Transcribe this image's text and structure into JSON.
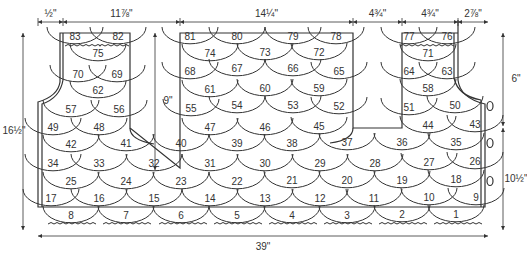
{
  "diagram": {
    "stroke_color": "#333333",
    "background": "#ffffff",
    "dimensions": {
      "top": [
        {
          "id": "left-strap-edge",
          "label": "½\"",
          "x1": 38,
          "x2": 63
        },
        {
          "id": "left-neck",
          "label": "11⅞\"",
          "x1": 63,
          "x2": 180
        },
        {
          "id": "back-neck",
          "label": "14¼\"",
          "x1": 180,
          "x2": 353
        },
        {
          "id": "right-neck",
          "label": "4¾\"",
          "x1": 353,
          "x2": 402
        },
        {
          "id": "right-strap",
          "label": "4¾\"",
          "x1": 402,
          "x2": 458
        },
        {
          "id": "right-armhole",
          "label": "2⅞\"",
          "x1": 458,
          "x2": 488
        }
      ],
      "bottom": {
        "label": "39\"",
        "x1": 38,
        "x2": 488,
        "y": 236
      },
      "left_height": {
        "label": "16½\"",
        "y1": 33,
        "y2": 230,
        "x": 23
      },
      "neck_depth": {
        "label": "9\"",
        "y1": 33,
        "y2": 170,
        "x": 155
      },
      "armhole_depth": {
        "label": "6\"",
        "y1": 33,
        "y2": 126,
        "x": 503
      },
      "side_height": {
        "label": "10½\"",
        "y1": 128,
        "y2": 230,
        "x": 503
      }
    },
    "scallops": [
      {
        "n": "83",
        "x": 75,
        "y": 37
      },
      {
        "n": "82",
        "x": 118,
        "y": 37
      },
      {
        "n": "81",
        "x": 190,
        "y": 37
      },
      {
        "n": "80",
        "x": 237,
        "y": 37
      },
      {
        "n": "79",
        "x": 293,
        "y": 37
      },
      {
        "n": "78",
        "x": 336,
        "y": 37
      },
      {
        "n": "77",
        "x": 409,
        "y": 37
      },
      {
        "n": "76",
        "x": 447,
        "y": 37
      },
      {
        "n": "75",
        "x": 98,
        "y": 54
      },
      {
        "n": "74",
        "x": 210,
        "y": 54
      },
      {
        "n": "73",
        "x": 265,
        "y": 53
      },
      {
        "n": "72",
        "x": 319,
        "y": 53
      },
      {
        "n": "71",
        "x": 428,
        "y": 54
      },
      {
        "n": "70",
        "x": 78,
        "y": 75
      },
      {
        "n": "69",
        "x": 117,
        "y": 75
      },
      {
        "n": "68",
        "x": 190,
        "y": 72
      },
      {
        "n": "67",
        "x": 237,
        "y": 69
      },
      {
        "n": "66",
        "x": 293,
        "y": 69
      },
      {
        "n": "65",
        "x": 339,
        "y": 72
      },
      {
        "n": "64",
        "x": 409,
        "y": 72
      },
      {
        "n": "63",
        "x": 447,
        "y": 72
      },
      {
        "n": "62",
        "x": 98,
        "y": 91
      },
      {
        "n": "61",
        "x": 210,
        "y": 90
      },
      {
        "n": "60",
        "x": 265,
        "y": 89
      },
      {
        "n": "59",
        "x": 319,
        "y": 89
      },
      {
        "n": "58",
        "x": 428,
        "y": 89
      },
      {
        "n": "57",
        "x": 71,
        "y": 110
      },
      {
        "n": "56",
        "x": 119,
        "y": 110
      },
      {
        "n": "55",
        "x": 191,
        "y": 109
      },
      {
        "n": "54",
        "x": 237,
        "y": 106
      },
      {
        "n": "53",
        "x": 293,
        "y": 106
      },
      {
        "n": "52",
        "x": 339,
        "y": 107
      },
      {
        "n": "51",
        "x": 409,
        "y": 108
      },
      {
        "n": "50",
        "x": 455,
        "y": 106
      },
      {
        "n": "49",
        "x": 53,
        "y": 128
      },
      {
        "n": "48",
        "x": 99,
        "y": 128
      },
      {
        "n": "47",
        "x": 210,
        "y": 128
      },
      {
        "n": "46",
        "x": 265,
        "y": 128
      },
      {
        "n": "45",
        "x": 319,
        "y": 127
      },
      {
        "n": "44",
        "x": 428,
        "y": 126
      },
      {
        "n": "43",
        "x": 475,
        "y": 125
      },
      {
        "n": "42",
        "x": 71,
        "y": 145
      },
      {
        "n": "41",
        "x": 126,
        "y": 144
      },
      {
        "n": "40",
        "x": 181,
        "y": 144
      },
      {
        "n": "39",
        "x": 237,
        "y": 144
      },
      {
        "n": "38",
        "x": 292,
        "y": 144
      },
      {
        "n": "37",
        "x": 347,
        "y": 143
      },
      {
        "n": "36",
        "x": 402,
        "y": 143
      },
      {
        "n": "35",
        "x": 456,
        "y": 143
      },
      {
        "n": "34",
        "x": 53,
        "y": 164
      },
      {
        "n": "33",
        "x": 99,
        "y": 164
      },
      {
        "n": "32",
        "x": 154,
        "y": 164
      },
      {
        "n": "31",
        "x": 210,
        "y": 164
      },
      {
        "n": "30",
        "x": 265,
        "y": 164
      },
      {
        "n": "29",
        "x": 320,
        "y": 164
      },
      {
        "n": "28",
        "x": 375,
        "y": 164
      },
      {
        "n": "27",
        "x": 429,
        "y": 163
      },
      {
        "n": "26",
        "x": 475,
        "y": 162
      },
      {
        "n": "25",
        "x": 71,
        "y": 182
      },
      {
        "n": "24",
        "x": 126,
        "y": 182
      },
      {
        "n": "23",
        "x": 181,
        "y": 182
      },
      {
        "n": "22",
        "x": 237,
        "y": 182
      },
      {
        "n": "21",
        "x": 292,
        "y": 181
      },
      {
        "n": "20",
        "x": 347,
        "y": 181
      },
      {
        "n": "19",
        "x": 402,
        "y": 181
      },
      {
        "n": "18",
        "x": 456,
        "y": 180
      },
      {
        "n": "17",
        "x": 51,
        "y": 199
      },
      {
        "n": "16",
        "x": 99,
        "y": 199
      },
      {
        "n": "15",
        "x": 154,
        "y": 199
      },
      {
        "n": "14",
        "x": 210,
        "y": 199
      },
      {
        "n": "13",
        "x": 265,
        "y": 199
      },
      {
        "n": "12",
        "x": 320,
        "y": 199
      },
      {
        "n": "11",
        "x": 374,
        "y": 199
      },
      {
        "n": "10",
        "x": 429,
        "y": 198
      },
      {
        "n": "9",
        "x": 476,
        "y": 198
      },
      {
        "n": "8",
        "x": 71,
        "y": 216
      },
      {
        "n": "7",
        "x": 126,
        "y": 216
      },
      {
        "n": "6",
        "x": 181,
        "y": 216
      },
      {
        "n": "5",
        "x": 237,
        "y": 216
      },
      {
        "n": "4",
        "x": 292,
        "y": 216
      },
      {
        "n": "3",
        "x": 347,
        "y": 216
      },
      {
        "n": "2",
        "x": 402,
        "y": 215
      },
      {
        "n": "1",
        "x": 456,
        "y": 215
      }
    ],
    "buttons": [
      {
        "x": 490,
        "y": 106
      },
      {
        "x": 490,
        "y": 143
      },
      {
        "x": 490,
        "y": 181
      }
    ]
  }
}
